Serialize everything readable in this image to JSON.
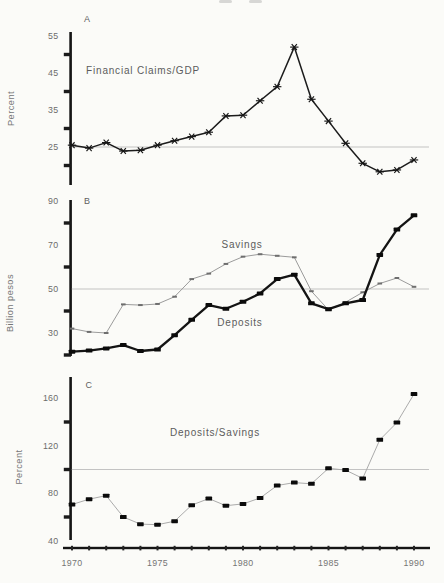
{
  "figure": {
    "background": "#fbfbf8",
    "text_color": "#6b6b6b",
    "line_color": "#1c1c1c",
    "refline_color": "#bcbcbc"
  },
  "chart_data": [
    {
      "panel": "A",
      "type": "line",
      "title": "Financial Claims/GDP",
      "ylabel": "Percent",
      "ylim": [
        15,
        56
      ],
      "ytick_labels": [
        55,
        45,
        35,
        25
      ],
      "ytick_marks": [
        50,
        40,
        30,
        20
      ],
      "refline": 25,
      "grid": false,
      "x": [
        1970,
        1971,
        1972,
        1973,
        1974,
        1975,
        1976,
        1977,
        1978,
        1979,
        1980,
        1981,
        1982,
        1983,
        1984,
        1985,
        1986,
        1987,
        1988,
        1989,
        1990
      ],
      "series": [
        {
          "name": "Financial Claims/GDP",
          "marker": "x-dash",
          "style": "main",
          "values": [
            25.5,
            24.7,
            26.2,
            23.9,
            24.1,
            25.5,
            26.7,
            27.8,
            29.0,
            33.4,
            33.6,
            37.5,
            41.3,
            52.0,
            37.9,
            32.0,
            26.0,
            20.6,
            18.3,
            18.8,
            21.5
          ]
        }
      ]
    },
    {
      "panel": "B",
      "type": "line",
      "title": "",
      "ylabel": "Billion pesos",
      "ylim": [
        19,
        91
      ],
      "ytick_labels": [
        90,
        70,
        50,
        30
      ],
      "ytick_marks": [
        80,
        60,
        40,
        20
      ],
      "refline": 50,
      "grid": false,
      "x": [
        1970,
        1971,
        1972,
        1973,
        1974,
        1975,
        1976,
        1977,
        1978,
        1979,
        1980,
        1981,
        1982,
        1983,
        1984,
        1985,
        1986,
        1987,
        1988,
        1989,
        1990
      ],
      "series": [
        {
          "name": "Savings",
          "marker": "dash",
          "style": "thin",
          "values": [
            32,
            30.5,
            30,
            43,
            42.7,
            43.2,
            46.5,
            54.5,
            57,
            61.4,
            64.7,
            65.8,
            65.1,
            64.4,
            49,
            40.5,
            44,
            48.5,
            52.5,
            55,
            51
          ]
        },
        {
          "name": "Deposits",
          "marker": "square",
          "style": "thick",
          "values": [
            21.5,
            22,
            23,
            24.5,
            21.8,
            22.5,
            29,
            36,
            42.7,
            41,
            44.2,
            48,
            54.5,
            56.5,
            43.5,
            40.8,
            43.5,
            45,
            65.5,
            77,
            83.5
          ]
        }
      ]
    },
    {
      "panel": "C",
      "type": "line",
      "title": "Deposits/Savings",
      "ylabel": "Percent",
      "ylim": [
        41,
        178
      ],
      "ytick_labels": [
        160,
        120,
        80,
        40
      ],
      "ytick_marks": [
        140,
        100,
        60
      ],
      "refline": 100,
      "grid": false,
      "x": [
        1970,
        1971,
        1972,
        1973,
        1974,
        1975,
        1976,
        1977,
        1978,
        1979,
        1980,
        1981,
        1982,
        1983,
        1984,
        1985,
        1986,
        1987,
        1988,
        1989,
        1990
      ],
      "series": [
        {
          "name": "Deposits/Savings",
          "marker": "square",
          "style": "ratio",
          "values": [
            70.5,
            75,
            78,
            60,
            54,
            53.5,
            56.5,
            70,
            75.5,
            69.5,
            71,
            76,
            86.5,
            89,
            88,
            101,
            99.5,
            92.5,
            125,
            139.5,
            163.5
          ]
        }
      ]
    }
  ],
  "x_axis": {
    "ticks": [
      1970,
      1971,
      1972,
      1973,
      1974,
      1975,
      1976,
      1977,
      1978,
      1979,
      1980,
      1981,
      1982,
      1983,
      1984,
      1985,
      1986,
      1987,
      1988,
      1989,
      1990,
      1991
    ],
    "labels": [
      1970,
      1975,
      1980,
      1985,
      1990
    ]
  }
}
